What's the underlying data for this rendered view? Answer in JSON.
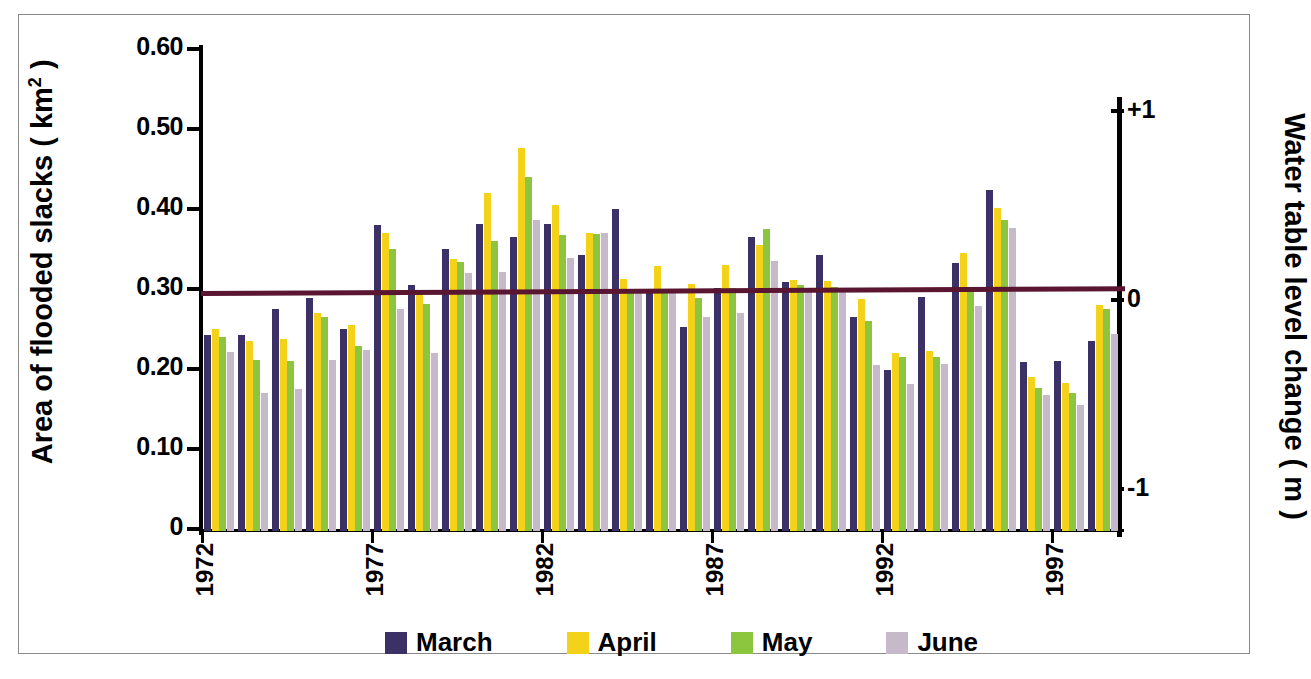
{
  "chart_data": {
    "type": "bar",
    "title": "",
    "ylabel": "Area of flooded slacks  ( km2 )",
    "ylabel_plain": "Area of flooded slacks ( km^2 )",
    "y2label": "Water table level change  ( m )",
    "xlabel": "",
    "ylim": [
      0,
      0.6
    ],
    "y2lim": [
      -1.45,
      1.0
    ],
    "ytick_labels": [
      "0.60",
      "0.50",
      "0.40",
      "0.30",
      "0.20",
      "0.10",
      "0"
    ],
    "ytick_values": [
      0.6,
      0.5,
      0.4,
      0.3,
      0.2,
      0.1,
      0
    ],
    "y2tick_labels": [
      "+1",
      "0",
      "-1"
    ],
    "y2tick_values": [
      1,
      0,
      -1
    ],
    "xtick_labels": [
      "1972",
      "1977",
      "1982",
      "1987",
      "1992",
      "1997"
    ],
    "xtick_values": [
      1972,
      1977,
      1982,
      1987,
      1992,
      1997
    ],
    "grid": false,
    "legend_position": "bottom",
    "categories": [
      1972,
      1973,
      1974,
      1975,
      1976,
      1977,
      1978,
      1979,
      1980,
      1981,
      1982,
      1983,
      1984,
      1985,
      1986,
      1987,
      1988,
      1989,
      1990,
      1991,
      1992,
      1993,
      1994,
      1995,
      1996,
      1997,
      1998
    ],
    "series": [
      {
        "name": "March",
        "color": "#3b3166",
        "values": [
          0.245,
          0.245,
          0.277,
          0.291,
          0.252,
          0.382,
          0.308,
          0.352,
          0.384,
          0.368,
          0.384,
          0.345,
          0.403,
          0.302,
          0.255,
          0.304,
          0.368,
          0.311,
          0.345,
          0.268,
          0.201,
          0.293,
          0.335,
          0.426,
          0.211,
          0.212,
          0.237
        ]
      },
      {
        "name": "April",
        "color": "#f5d21a",
        "values": [
          0.252,
          0.238,
          0.24,
          0.273,
          0.258,
          0.372,
          0.299,
          0.34,
          0.423,
          0.479,
          0.407,
          0.372,
          0.315,
          0.331,
          0.309,
          0.332,
          0.357,
          0.314,
          0.312,
          0.29,
          0.222,
          0.225,
          0.348,
          0.404,
          0.192,
          0.185,
          0.283
        ]
      },
      {
        "name": "May",
        "color": "#8cc63e",
        "values": [
          0.243,
          0.214,
          0.213,
          0.268,
          0.231,
          0.353,
          0.284,
          0.336,
          0.363,
          0.443,
          0.37,
          0.371,
          0.303,
          0.303,
          0.291,
          0.304,
          0.377,
          0.307,
          0.305,
          0.263,
          0.218,
          0.218,
          0.303,
          0.389,
          0.179,
          0.172,
          0.277
        ]
      },
      {
        "name": "June",
        "color": "#c6b9c9",
        "values": [
          0.224,
          0.172,
          0.177,
          0.214,
          0.226,
          0.277,
          0.222,
          0.323,
          0.324,
          0.389,
          0.341,
          0.372,
          0.3,
          0.301,
          0.267,
          0.272,
          0.337,
          0.302,
          0.302,
          0.208,
          0.184,
          0.209,
          0.281,
          0.379,
          0.17,
          0.157,
          0.246
        ]
      }
    ],
    "trend_line": {
      "name": "Water table level change",
      "color": "#5a1530",
      "y_start": 0.297,
      "y_end": 0.303
    }
  },
  "legend": {
    "items": [
      {
        "label": "March",
        "color": "#3b3166"
      },
      {
        "label": "April",
        "color": "#f5d21a"
      },
      {
        "label": "May",
        "color": "#8cc63e"
      },
      {
        "label": "June",
        "color": "#c6b9c9"
      }
    ]
  },
  "axes": {
    "left_title_pre": "Area of flooded slacks  ( km",
    "left_title_sup": "2",
    "left_title_post": " )",
    "right_title": "Water table level change   ( m )"
  },
  "caption": ""
}
